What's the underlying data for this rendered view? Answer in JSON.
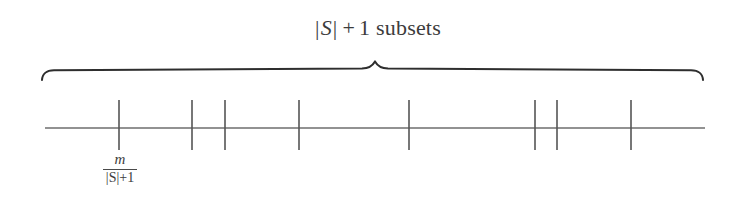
{
  "figure": {
    "background_color": "#ffffff",
    "ink_color": "#4a4a4a",
    "brace_color": "#2e2e2e",
    "brace_label": {
      "full_text": "|S| + 1 subsets",
      "abs_open": "|",
      "set_symbol": "S",
      "abs_close": "|",
      "operator": "+",
      "operand": "1",
      "noun": "subsets"
    },
    "tick_label": {
      "full_text": "m/(|S|+1)",
      "numerator": "m",
      "denominator": "|S|+1"
    },
    "axis": {
      "x_start": 45,
      "x_end": 705,
      "y": 128
    },
    "brace": {
      "x_start": 42,
      "x_end": 703,
      "y_flat": 70,
      "y_tip": 80,
      "center_x": 375,
      "center_peak_y": 60
    },
    "ticks": [
      {
        "id": "tick-1",
        "x": 119,
        "y_top": 100,
        "y_bottom": 150
      },
      {
        "id": "tick-2",
        "x": 192,
        "y_top": 100,
        "y_bottom": 150
      },
      {
        "id": "tick-3",
        "x": 225,
        "y_top": 100,
        "y_bottom": 150
      },
      {
        "id": "tick-4",
        "x": 299,
        "y_top": 100,
        "y_bottom": 150
      },
      {
        "id": "tick-5",
        "x": 409,
        "y_top": 100,
        "y_bottom": 150
      },
      {
        "id": "tick-6",
        "x": 535,
        "y_top": 100,
        "y_bottom": 150
      },
      {
        "id": "tick-7",
        "x": 557,
        "y_top": 100,
        "y_bottom": 150
      },
      {
        "id": "tick-8",
        "x": 631,
        "y_top": 100,
        "y_bottom": 150
      }
    ]
  }
}
